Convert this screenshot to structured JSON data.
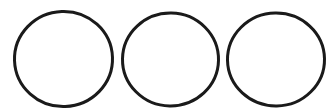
{
  "canvas": {
    "width": 336,
    "height": 112,
    "background_color": "#ffffff",
    "description": "Three hand-drawn black circle outlines arranged in a horizontal row on a plain white background"
  },
  "style": {
    "stroke_color": "#1a1a1a",
    "stroke_width": 3,
    "fill": "none"
  },
  "shapes": [
    {
      "name": "circle-left",
      "type": "ellipse",
      "cx": 63.5,
      "cy": 59.0,
      "rx": 49.0,
      "ry": 47.5,
      "rotation": -2,
      "stroke_color": "#1a1a1a",
      "stroke_width": 3
    },
    {
      "name": "circle-middle",
      "type": "ellipse",
      "cx": 170.5,
      "cy": 59.5,
      "rx": 48.0,
      "ry": 46.5,
      "rotation": 1,
      "stroke_color": "#1a1a1a",
      "stroke_width": 3
    },
    {
      "name": "circle-right",
      "type": "ellipse",
      "cx": 276.0,
      "cy": 59.5,
      "rx": 48.5,
      "ry": 46.5,
      "rotation": -1,
      "stroke_color": "#1a1a1a",
      "stroke_width": 3
    }
  ]
}
